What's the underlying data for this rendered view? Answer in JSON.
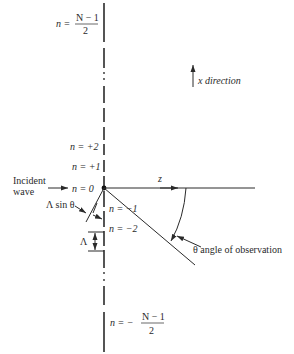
{
  "diagram": {
    "type": "linear array diffraction geometry",
    "labels": {
      "top_n": "n =",
      "top_frac_num": "N − 1",
      "top_frac_den": "2",
      "bottom_n": "n = −",
      "bottom_frac_num": "N − 1",
      "bottom_frac_den": "2",
      "x_direction": "x direction",
      "n_plus2": "n = +2",
      "n_plus1": "n = +1",
      "n_zero": "n = 0",
      "n_minus1": "n = −1",
      "n_minus2": "n = −2",
      "incident_line1": "Incident",
      "incident_line2": "wave",
      "lambda_sin_theta": "Λ sin θ",
      "lambda": "Λ",
      "z": "z",
      "theta_label": "θ angle of observation"
    },
    "colors": {
      "ink": "#2a2a2a",
      "background": "#ffffff"
    }
  }
}
